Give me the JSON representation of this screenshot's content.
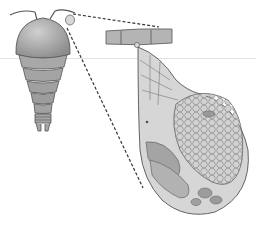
{
  "diagram": {
    "parts": [
      {
        "id": "copepod-body",
        "label": ""
      },
      {
        "id": "antennae",
        "label": ""
      },
      {
        "id": "egg-sac-small",
        "label": ""
      },
      {
        "id": "appendage-segment",
        "label": ""
      },
      {
        "id": "egg-sac-enlarged",
        "label": ""
      },
      {
        "id": "egg-cluster",
        "label": ""
      }
    ],
    "connectors": [
      "dashed-line-top",
      "dashed-line-bottom"
    ],
    "colors": {
      "body_fill": "#b8b8b8",
      "body_stroke": "#555555",
      "sac_fill": "#d4d4d4",
      "egg_fill": "#c8c8c8",
      "dash": "#333333",
      "rule": "#e2e2e2"
    }
  }
}
